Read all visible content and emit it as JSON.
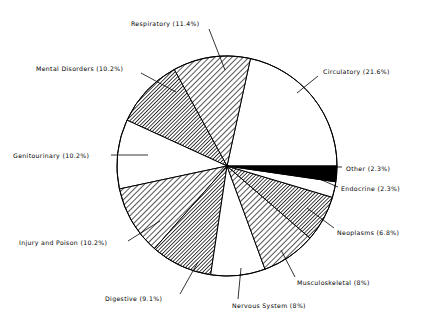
{
  "chart_data": {
    "type": "pie",
    "title": "",
    "subtitle": "",
    "xlabel": "",
    "ylabel": "",
    "legend_position": "none",
    "grid": false,
    "labels_show_percent": true,
    "start_angle_deg": 0,
    "direction": "counterclockwise",
    "categories": [
      "Circulatory",
      "Respiratory",
      "Mental Disorders",
      "Genitourinary",
      "Injury and Poison",
      "Digestive",
      "Nervous System",
      "Musculoskeletal",
      "Neoplasms",
      "Endocrine",
      "Other"
    ],
    "values": [
      21.6,
      11.4,
      10.2,
      10.2,
      10.2,
      9.1,
      8.0,
      8.0,
      6.8,
      2.3,
      2.3
    ],
    "slices": [
      {
        "name": "Circulatory",
        "value": 21.6,
        "label": "Circulatory (21.6%)",
        "fill": "white",
        "color": "#ffffff",
        "label_x": 323,
        "label_y": 74,
        "leader": "M 318 76 L 297 93"
      },
      {
        "name": "Respiratory",
        "value": 11.4,
        "label": "Respiratory (11.4%)",
        "fill": "light-hatch",
        "color": "#b9b9b9",
        "label_x": 131,
        "label_y": 26,
        "leader": "M 209 29 L 225 70"
      },
      {
        "name": "Mental Disorders",
        "value": 10.2,
        "label": "Mental Disorders (10.2%)",
        "fill": "dark-hatch",
        "color": "#6a6a6a",
        "label_x": 36,
        "label_y": 71,
        "leader": "M 141 73 L 176 92"
      },
      {
        "name": "Genitourinary",
        "value": 10.2,
        "label": "Genitourinary (10.2%)",
        "fill": "white",
        "color": "#ffffff",
        "label_x": 13,
        "label_y": 158,
        "leader": "M 111 155 L 148 155"
      },
      {
        "name": "Injury and Poison",
        "value": 10.2,
        "label": "Injury and Poison (10.2%)",
        "fill": "light-hatch",
        "color": "#b9b9b9",
        "label_x": 19,
        "label_y": 245,
        "leader": "M 128 241 L 160 221"
      },
      {
        "name": "Digestive",
        "value": 9.1,
        "label": "Digestive (9.1%)",
        "fill": "dark-hatch",
        "color": "#6a6a6a",
        "label_x": 105,
        "label_y": 301,
        "leader": "M 180 294 L 198 262"
      },
      {
        "name": "Nervous System",
        "value": 8.0,
        "label": "Nervous System (8%)",
        "fill": "white",
        "color": "#ffffff",
        "label_x": 232,
        "label_y": 308,
        "leader": "M 238 299 L 241 268"
      },
      {
        "name": "Musculoskeletal",
        "value": 8.0,
        "label": "Musculoskeletal (8%)",
        "fill": "light-hatch",
        "color": "#b9b9b9",
        "label_x": 297,
        "label_y": 285,
        "leader": "M 295 277 L 281 250"
      },
      {
        "name": "Neoplasms",
        "value": 6.8,
        "label": "Neoplasms (6.8%)",
        "fill": "dark-hatch",
        "color": "#6a6a6a",
        "label_x": 337,
        "label_y": 235,
        "leader": "M 334 228 L 307 208"
      },
      {
        "name": "Endocrine",
        "value": 2.3,
        "label": "Endocrine (2.3%)",
        "fill": "white",
        "color": "#ffffff",
        "label_x": 341,
        "label_y": 191,
        "leader": "M 338 187 L 310 175"
      },
      {
        "name": "Other",
        "value": 2.3,
        "label": "Other (2.3%)",
        "fill": "black",
        "color": "#000000",
        "label_x": 346,
        "label_y": 171,
        "leader": "M 342 167 L 313 167"
      }
    ],
    "geometry": {
      "center_x": 227,
      "center_y": 166,
      "radius": 110
    }
  }
}
